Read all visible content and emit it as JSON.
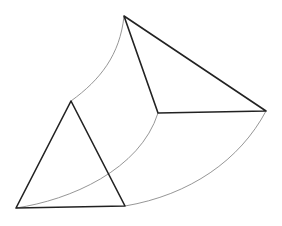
{
  "diagram": {
    "colors": {
      "edge": "#222222",
      "arc": "#8a8a8a",
      "background": "#ffffff"
    },
    "large_triangle": {
      "vertices": [
        [
          124,
          16
        ],
        [
          266,
          111
        ],
        [
          158,
          113
        ]
      ]
    },
    "small_triangle": {
      "vertices": [
        [
          71,
          101
        ],
        [
          16,
          208
        ],
        [
          125,
          206
        ]
      ]
    },
    "arcs": [
      {
        "from": [
          124,
          16
        ],
        "to": [
          71,
          101
        ],
        "path": "M124 16 C 120 55, 100 80, 71 101"
      },
      {
        "from": [
          158,
          113
        ],
        "to": [
          16,
          208
        ],
        "path": "M158 113 C 140 170, 70 200, 16 208"
      },
      {
        "from": [
          266,
          111
        ],
        "to": [
          125,
          206
        ],
        "path": "M266 111 C 240 160, 190 195, 125 206"
      }
    ]
  }
}
